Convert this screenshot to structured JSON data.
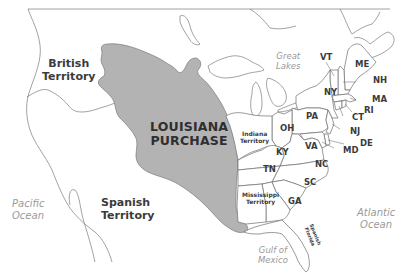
{
  "map": {
    "title": "Louisiana Purchase",
    "colors": {
      "purchase_fill": "#b3b3b3",
      "land_fill": "#ffffff",
      "border": "#6e6e6e",
      "label_text": "#3b3b3b",
      "water_text": "#9a9a9a"
    },
    "regions": {
      "louisiana_purchase": "LOUISIANA\nPURCHASE",
      "british_territory": "British\nTerritory",
      "spanish_territory": "Spanish\nTerritory",
      "indiana_territory": "Indiana\nTerritory",
      "mississippi_territory": "Mississippi\nTerritory",
      "spanish_florida": "Spanish\nFlorida"
    },
    "states": {
      "VT": "VT",
      "ME": "ME",
      "NH": "NH",
      "NY": "NY",
      "MA": "MA",
      "RI": "RI",
      "CT": "CT",
      "PA": "PA",
      "NJ": "NJ",
      "DE": "DE",
      "MD": "MD",
      "OH": "OH",
      "VA": "VA",
      "KY": "KY",
      "NC": "NC",
      "TN": "TN",
      "SC": "SC",
      "GA": "GA"
    },
    "water": {
      "great_lakes": "Great\nLakes",
      "pacific_ocean": "Pacific\nOcean",
      "atlantic_ocean": "Atlantic\nOcean",
      "gulf_of_mexico": "Gulf of\nMexico"
    }
  }
}
